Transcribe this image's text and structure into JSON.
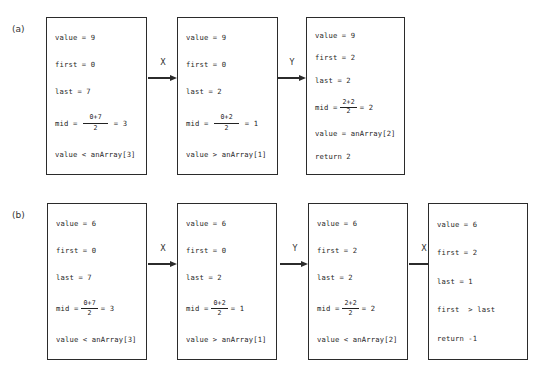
{
  "figure": {
    "type": "binary-search-trace-diagram",
    "rows": [
      {
        "label": "(a)",
        "boxes": [
          {
            "name": "step-1",
            "lines": [
              {
                "kind": "text",
                "text": "value = 9"
              },
              {
                "kind": "text",
                "text": "first = 0"
              },
              {
                "kind": "text",
                "text": "last = 7"
              },
              {
                "kind": "fraction",
                "prefix": "mid =",
                "num": "0+7",
                "den": "2",
                "suffix": "= 3",
                "wide": true
              },
              {
                "kind": "text",
                "text": "value < anArray[3]"
              }
            ]
          },
          {
            "name": "step-2",
            "lines": [
              {
                "kind": "text",
                "text": "value = 9"
              },
              {
                "kind": "text",
                "text": "first = 0"
              },
              {
                "kind": "text",
                "text": "last = 2"
              },
              {
                "kind": "fraction",
                "prefix": "mid =",
                "num": "0+2",
                "den": "2",
                "suffix": "= 1",
                "wide": true
              },
              {
                "kind": "text",
                "text": "value > anArray[1]"
              }
            ]
          },
          {
            "name": "step-3",
            "lines": [
              {
                "kind": "text",
                "text": "value = 9"
              },
              {
                "kind": "text",
                "text": "first = 2"
              },
              {
                "kind": "text",
                "text": "last = 2"
              },
              {
                "kind": "fraction",
                "prefix": "mid =",
                "num": "2+2",
                "den": "2",
                "suffix": "= 2",
                "wide": false
              },
              {
                "kind": "text",
                "text": "value = anArray[2]"
              },
              {
                "kind": "text",
                "text": "return 2"
              }
            ]
          }
        ],
        "arrows": [
          {
            "label": "X"
          },
          {
            "label": "Y"
          }
        ]
      },
      {
        "label": "(b)",
        "boxes": [
          {
            "name": "step-1",
            "lines": [
              {
                "kind": "text",
                "text": "value = 6"
              },
              {
                "kind": "text",
                "text": "first = 0"
              },
              {
                "kind": "text",
                "text": "last = 7"
              },
              {
                "kind": "fraction",
                "prefix": "mid =",
                "num": "0+7",
                "den": "2",
                "suffix": "= 3",
                "wide": false
              },
              {
                "kind": "text",
                "text": "value < anArray[3]"
              }
            ]
          },
          {
            "name": "step-2",
            "lines": [
              {
                "kind": "text",
                "text": "value = 6"
              },
              {
                "kind": "text",
                "text": "first = 0"
              },
              {
                "kind": "text",
                "text": "last = 2"
              },
              {
                "kind": "fraction",
                "prefix": "mid =",
                "num": "0+2",
                "den": "2",
                "suffix": "= 1",
                "wide": false
              },
              {
                "kind": "text",
                "text": "value > anArray[1]"
              }
            ]
          },
          {
            "name": "step-3",
            "lines": [
              {
                "kind": "text",
                "text": "value = 6"
              },
              {
                "kind": "text",
                "text": "first = 2"
              },
              {
                "kind": "text",
                "text": "last = 2"
              },
              {
                "kind": "fraction",
                "prefix": "mid =",
                "num": "2+2",
                "den": "2",
                "suffix": "= 2",
                "wide": false
              },
              {
                "kind": "text",
                "text": "value < anArray[2]"
              }
            ]
          },
          {
            "name": "step-4",
            "lines": [
              {
                "kind": "text",
                "text": "value = 6"
              },
              {
                "kind": "text",
                "text": "first = 2"
              },
              {
                "kind": "text",
                "text": "last = 1"
              },
              {
                "kind": "text",
                "text": "first  > last"
              },
              {
                "kind": "text",
                "text": "return -1"
              }
            ]
          }
        ],
        "arrows": [
          {
            "label": "X"
          },
          {
            "label": "Y"
          },
          {
            "label": "X"
          }
        ]
      }
    ]
  },
  "colors": {
    "box_border": "#2b2b2b",
    "text": "#1f1f1f",
    "background": "#ffffff"
  }
}
